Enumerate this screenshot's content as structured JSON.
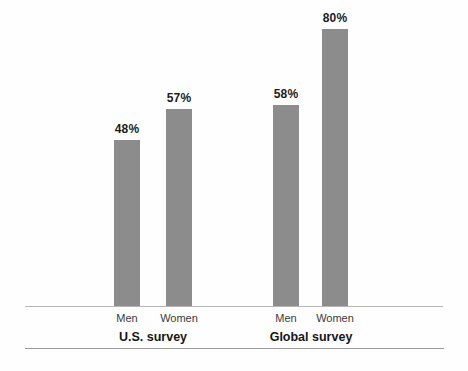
{
  "chart_data": {
    "type": "bar",
    "categories": [
      "Men",
      "Women"
    ],
    "groups": [
      {
        "label": "U.S. survey",
        "values": [
          48,
          57
        ]
      },
      {
        "label": "Global survey",
        "values": [
          58,
          80
        ]
      }
    ],
    "values_flat": [
      48,
      57,
      58,
      80
    ],
    "value_labels": [
      "48%",
      "57%",
      "58%",
      "80%"
    ],
    "value_suffix": "%",
    "title": "",
    "xlabel": "",
    "ylabel": "",
    "ylim": [
      0,
      100
    ],
    "grid": false,
    "legend": "none",
    "colors": {
      "bar": "#8c8c8c",
      "value_label": "#1c1c1c",
      "category_label": "#3a3a3a",
      "group_label": "#161616",
      "baseline": "#b5b5b5",
      "bottom_rule": "#9b9b9b",
      "background": "#fefefe"
    }
  }
}
